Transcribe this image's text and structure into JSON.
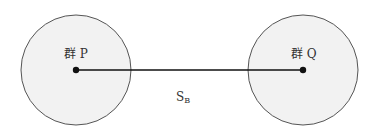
{
  "diagram": {
    "groups": [
      {
        "id": "P",
        "label": "群 P",
        "cx": 76,
        "cy": 70,
        "r": 55
      },
      {
        "id": "Q",
        "label": "群 Q",
        "cx": 303,
        "cy": 70,
        "r": 55
      }
    ],
    "connector": {
      "label_main": "S",
      "label_sub": "B"
    },
    "colors": {
      "circle_fill": "#f2f2f2",
      "circle_stroke": "#555555",
      "line": "#111111"
    }
  }
}
